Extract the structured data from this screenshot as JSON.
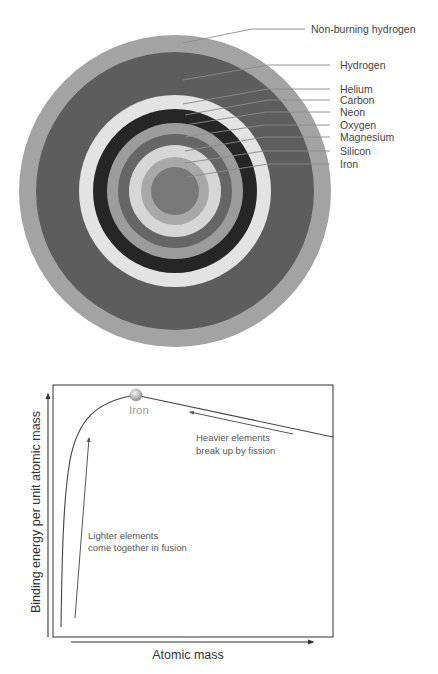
{
  "star_diagram": {
    "title": "Onion-layer structure of a massive star",
    "center": [
      175,
      191
    ],
    "layers": [
      {
        "name": "Non-burning hydrogen",
        "radius": 156,
        "color": "#a3a3a3",
        "label_y": 29,
        "line_start": [
          183,
          43
        ],
        "line_bend": [
          252,
          29
        ],
        "line_end": [
          305,
          29
        ],
        "label_x": 311
      },
      {
        "name": "Hydrogen",
        "radius": 139,
        "color": "#5d5d5d",
        "label_y": 65,
        "line_start": [
          183,
          80
        ],
        "line_bend": [
          268,
          65
        ],
        "line_end": [
          330,
          65
        ],
        "label_x": 340
      },
      {
        "name": "Helium",
        "radius": 96,
        "color": "#e3e3e3",
        "label_y": 89,
        "line_start": [
          183,
          104
        ],
        "line_bend": [
          268,
          89
        ],
        "line_end": [
          330,
          89
        ],
        "label_x": 340
      },
      {
        "name": "Carbon",
        "radius": 82,
        "color": "#262626",
        "label_y": 100,
        "line_start": [
          185,
          115
        ],
        "line_bend": [
          268,
          100
        ],
        "line_end": [
          330,
          100
        ],
        "label_x": 340
      },
      {
        "name": "Neon",
        "radius": 68,
        "color": "#9c9c9c",
        "label_y": 112,
        "line_start": [
          185,
          125
        ],
        "line_bend": [
          266,
          112
        ],
        "line_end": [
          330,
          112
        ],
        "label_x": 340
      },
      {
        "name": "Oxygen",
        "radius": 57,
        "color": "#666666",
        "label_y": 125,
        "line_start": [
          185,
          137
        ],
        "line_bend": [
          264,
          125
        ],
        "line_end": [
          330,
          125
        ],
        "label_x": 340
      },
      {
        "name": "Magnesium",
        "radius": 46,
        "color": "#d6d6d6",
        "label_y": 137,
        "line_start": [
          185,
          151
        ],
        "line_bend": [
          264,
          137
        ],
        "line_end": [
          330,
          137
        ],
        "label_x": 340
      },
      {
        "name": "Silicon",
        "radius": 34,
        "color": "#a8a8a8",
        "label_y": 151,
        "line_start": [
          185,
          163
        ],
        "line_bend": [
          264,
          151
        ],
        "line_end": [
          330,
          151
        ],
        "label_x": 340
      },
      {
        "name": "Iron",
        "radius": 24,
        "color": "#787878",
        "label_y": 164,
        "line_start": [
          187,
          177
        ],
        "line_bend": [
          268,
          164
        ],
        "line_end": [
          330,
          164
        ],
        "label_x": 340
      }
    ]
  },
  "chart_data": {
    "type": "line",
    "title": "",
    "xlabel": "Atomic mass",
    "ylabel": "Binding energy per unit atomic mass",
    "grid": false,
    "legend": null,
    "series": [
      {
        "name": "Binding energy curve",
        "shape": "rises steeply from low atomic mass to a peak at iron, then declines slowly toward heavier elements",
        "x_relative": [
          0.03,
          0.05,
          0.1,
          0.2,
          0.29,
          0.4,
          0.6,
          0.8,
          1.0
        ],
        "y_relative": [
          0.04,
          0.6,
          0.85,
          0.95,
          1.0,
          0.97,
          0.88,
          0.78,
          0.69
        ]
      }
    ],
    "annotations": [
      {
        "text": "Iron",
        "at": "peak of curve",
        "marker": "sphere"
      },
      {
        "text_lines": [
          "Lighter elements",
          "come together in fusion"
        ],
        "arrow": "upward, toward peak from low mass"
      },
      {
        "text_lines": [
          "Heavier elements",
          "break up by fission"
        ],
        "arrow": "leftward along curve, toward peak from high mass"
      }
    ]
  },
  "chart": {
    "iron_label": "Iron",
    "fusion_note": [
      "Lighter elements",
      "come together in fusion"
    ],
    "fission_note": [
      "Heavier elements",
      "break up by fission"
    ],
    "x_axis_label": "Atomic mass",
    "y_axis_label": "Binding energy per unit atomic mass",
    "colors": {
      "frame": "#333333",
      "curve": "#444444",
      "arrow": "#444444",
      "iron_ball": "#c8c8c8",
      "iron_text": "#9a9a9a"
    }
  }
}
